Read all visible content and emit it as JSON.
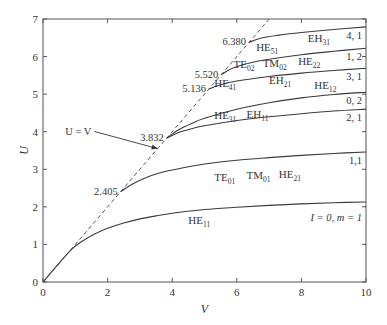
{
  "chart_data": {
    "type": "line",
    "title": "",
    "xlabel": "V",
    "ylabel": "U",
    "xlim": [
      0,
      10
    ],
    "ylim": [
      0,
      7
    ],
    "grid": false,
    "x_ticks": [
      0,
      2,
      4,
      6,
      8,
      10
    ],
    "y_ticks": [
      0,
      1,
      2,
      3,
      4,
      5,
      6,
      7
    ],
    "diagonal": {
      "label": "U = V",
      "style": "dashed",
      "points": [
        [
          0,
          0
        ],
        [
          7,
          7
        ]
      ],
      "label_pos": [
        1.5,
        3.9
      ],
      "arrow_to": [
        3.55,
        3.55
      ]
    },
    "series": [
      {
        "name": "l = 0, m = 1",
        "end_label": "I = 0, m = 1",
        "cutoff": 0,
        "points": [
          [
            0,
            0
          ],
          [
            0.5,
            0.5
          ],
          [
            0.9,
            0.88
          ],
          [
            1.2,
            1.08
          ],
          [
            1.6,
            1.28
          ],
          [
            2,
            1.43
          ],
          [
            2.5,
            1.57
          ],
          [
            3,
            1.68
          ],
          [
            3.5,
            1.76
          ],
          [
            4,
            1.83
          ],
          [
            5,
            1.93
          ],
          [
            6,
            1.99
          ],
          [
            7,
            2.04
          ],
          [
            8,
            2.08
          ],
          [
            9,
            2.11
          ],
          [
            10,
            2.13
          ]
        ],
        "modes": [
          {
            "base": "HE",
            "sub": "11",
            "x": 4.5,
            "y": 1.55
          }
        ]
      },
      {
        "name": "1,1",
        "end_label": "1,1",
        "cutoff": 2.405,
        "cutoff_label": "2.405",
        "points": [
          [
            2.405,
            2.405
          ],
          [
            2.8,
            2.62
          ],
          [
            3.2,
            2.78
          ],
          [
            3.6,
            2.9
          ],
          [
            4,
            2.98
          ],
          [
            5,
            3.14
          ],
          [
            6,
            3.24
          ],
          [
            7,
            3.31
          ],
          [
            8,
            3.37
          ],
          [
            9,
            3.42
          ],
          [
            10,
            3.46
          ]
        ],
        "modes": [
          {
            "base": "TE",
            "sub": "01",
            "x": 5.3,
            "y": 2.7
          },
          {
            "base": "TM",
            "sub": "01",
            "x": 6.3,
            "y": 2.75
          },
          {
            "base": "HE",
            "sub": "21",
            "x": 7.3,
            "y": 2.78
          }
        ]
      },
      {
        "name": "2,1",
        "end_label": "2, 1",
        "cutoff": 3.832,
        "cutoff_label": "3.832",
        "points": [
          [
            3.832,
            3.832
          ],
          [
            4.2,
            3.98
          ],
          [
            4.6,
            4.08
          ],
          [
            5,
            4.16
          ],
          [
            6,
            4.3
          ],
          [
            7,
            4.4
          ],
          [
            8,
            4.48
          ],
          [
            9,
            4.55
          ],
          [
            10,
            4.6
          ]
        ],
        "modes": [
          {
            "base": "HE",
            "sub": "31",
            "x": 5.3,
            "y": 4.35
          },
          {
            "base": "EH",
            "sub": "11",
            "x": 6.3,
            "y": 4.37
          }
        ]
      },
      {
        "name": "0,2",
        "end_label": "0, 2",
        "cutoff": 3.832,
        "points": [
          [
            3.832,
            3.832
          ],
          [
            4.2,
            4.05
          ],
          [
            4.6,
            4.22
          ],
          [
            5,
            4.36
          ],
          [
            6,
            4.6
          ],
          [
            7,
            4.77
          ],
          [
            8,
            4.9
          ],
          [
            9,
            4.99
          ],
          [
            10,
            5.05
          ]
        ],
        "modes": [
          {
            "base": "HE",
            "sub": "12",
            "x": 8.4,
            "y": 5.15
          }
        ]
      },
      {
        "name": "3,1",
        "end_label": "3, 1",
        "cutoff": 5.136,
        "cutoff_label": "5.136",
        "points": [
          [
            5.136,
            5.136
          ],
          [
            5.5,
            5.25
          ],
          [
            6,
            5.35
          ],
          [
            7,
            5.47
          ],
          [
            8,
            5.56
          ],
          [
            9,
            5.63
          ],
          [
            10,
            5.69
          ]
        ],
        "modes": [
          {
            "base": "HE",
            "sub": "41",
            "x": 5.3,
            "y": 5.18
          },
          {
            "base": "EH",
            "sub": "21",
            "x": 7.0,
            "y": 5.26
          }
        ]
      },
      {
        "name": "1,2",
        "end_label": "1, 2",
        "cutoff": 5.52,
        "cutoff_label": "5.520",
        "points": [
          [
            5.52,
            5.52
          ],
          [
            5.9,
            5.7
          ],
          [
            6.4,
            5.83
          ],
          [
            7,
            5.93
          ],
          [
            8,
            6.05
          ],
          [
            9,
            6.14
          ],
          [
            10,
            6.22
          ]
        ],
        "modes": [
          {
            "base": "TE",
            "sub": "02",
            "x": 5.9,
            "y": 5.7
          },
          {
            "base": "TM",
            "sub": "02",
            "x": 6.8,
            "y": 5.72
          },
          {
            "base": "HE",
            "sub": "22",
            "x": 7.9,
            "y": 5.77
          }
        ]
      },
      {
        "name": "4,1",
        "end_label": "4, 1",
        "cutoff": 6.38,
        "cutoff_label": "6.380",
        "points": [
          [
            6.38,
            6.38
          ],
          [
            6.8,
            6.5
          ],
          [
            7.3,
            6.57
          ],
          [
            8,
            6.64
          ],
          [
            9,
            6.72
          ],
          [
            10,
            6.79
          ]
        ],
        "modes": [
          {
            "base": "HE",
            "sub": "51",
            "x": 6.6,
            "y": 6.15
          },
          {
            "base": "EH",
            "sub": "31",
            "x": 8.2,
            "y": 6.4
          }
        ]
      }
    ]
  }
}
